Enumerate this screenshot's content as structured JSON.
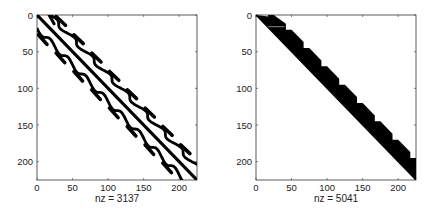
{
  "chart_data": [
    {
      "type": "heatmap",
      "subtype": "sparsity-pattern (spy plot)",
      "title": "",
      "xlabel": "nz = 3137",
      "ylabel": "",
      "nz": 3137,
      "xlim": [
        0,
        225
      ],
      "ylim": [
        225,
        0
      ],
      "xticks": [
        0,
        50,
        100,
        150,
        200
      ],
      "yticks": [
        0,
        50,
        100,
        150,
        200
      ],
      "grid": false,
      "description": "Symmetric banded matrix: main diagonal band with wavy off-diagonal bands at offsets ~±20 and dashed outer diagonal blocks at offsets ~±30",
      "bands": [
        {
          "offset": 0,
          "style": "solid"
        },
        {
          "offset": 18,
          "style": "wavy"
        },
        {
          "offset": -18,
          "style": "wavy"
        },
        {
          "offset": 30,
          "style": "dashed"
        },
        {
          "offset": -30,
          "style": "dashed"
        }
      ]
    },
    {
      "type": "heatmap",
      "subtype": "sparsity-pattern (spy plot)",
      "title": "",
      "xlabel": "nz = 5041",
      "ylabel": "",
      "nz": 5041,
      "xlim": [
        0,
        225
      ],
      "ylim": [
        225,
        0
      ],
      "xticks": [
        0,
        50,
        100,
        150,
        200
      ],
      "yticks": [
        0,
        50,
        100,
        150,
        200
      ],
      "grid": false,
      "description": "Upper-triangular factor: dense band above the diagonal with sawtooth profile, teeth every ~25 columns reaching ~30 above the diagonal",
      "tooth_period": 25,
      "tooth_height": 30
    }
  ],
  "plots": [
    {
      "xlabel": "nz = 3137"
    },
    {
      "xlabel": "nz = 5041"
    }
  ]
}
